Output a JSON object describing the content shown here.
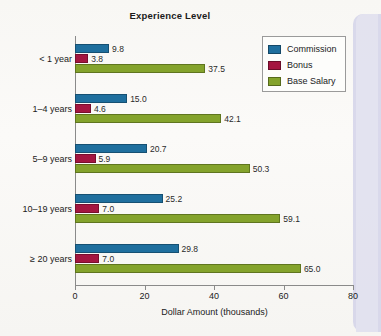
{
  "chart_data": {
    "type": "bar",
    "orientation": "horizontal",
    "title": "Experience Level",
    "xlabel": "Dollar Amount (thousands)",
    "ylabel": "",
    "xlim": [
      0,
      80
    ],
    "xticks": [
      0,
      20,
      40,
      60,
      80
    ],
    "grid": false,
    "legend_position": "top-right",
    "categories": [
      "< 1 year",
      "1–4 years",
      "5–9 years",
      "10–19 years",
      "≥ 20 years"
    ],
    "series": [
      {
        "name": "Commission",
        "color": "#1f6f9e",
        "values": [
          9.8,
          15.0,
          20.7,
          25.2,
          29.8
        ],
        "labels": [
          "9.8",
          "15.0",
          "20.7",
          "25.2",
          "29.8"
        ]
      },
      {
        "name": "Bonus",
        "color": "#a41540",
        "values": [
          3.8,
          4.6,
          5.9,
          7.0,
          7.0
        ],
        "labels": [
          "3.8",
          "4.6",
          "5.9",
          "7.0",
          "7.0"
        ]
      },
      {
        "name": "Base Salary",
        "color": "#84a32c",
        "values": [
          37.5,
          42.1,
          50.3,
          59.1,
          65.0
        ],
        "labels": [
          "37.5",
          "42.1",
          "50.3",
          "59.1",
          "65.0"
        ]
      }
    ]
  },
  "legend": {
    "items": [
      {
        "label": "Commission",
        "color": "#1f6f9e",
        "icon": "legend-swatch-blue"
      },
      {
        "label": "Bonus",
        "color": "#a41540",
        "icon": "legend-swatch-red"
      },
      {
        "label": "Base Salary",
        "color": "#84a32c",
        "icon": "legend-swatch-green"
      }
    ]
  },
  "axis": {
    "x_tick_labels": [
      "0",
      "20",
      "40",
      "60",
      "80"
    ],
    "x_title": "Dollar Amount (thousands)"
  },
  "colors": {
    "commission": "#1f6f9e",
    "bonus": "#a41540",
    "base_salary": "#84a32c",
    "axis": "#8a8a8a",
    "text": "#1b1b1b",
    "background": "#f8f7f4",
    "scan_strip": "#cfcfe8"
  }
}
